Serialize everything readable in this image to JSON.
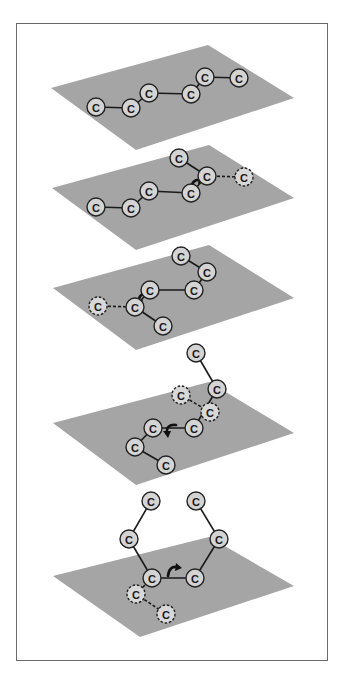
{
  "figure": {
    "colors": {
      "plane": "#a5a5a5",
      "atom_fill": "#d4d4d4",
      "atom_stroke": "#222222",
      "bond": "#1a1a1a",
      "frame": "#6a6a6a"
    },
    "atom_label": "C",
    "panels": [
      {
        "id": "step-1",
        "plane": [
          [
            208,
            45
          ],
          [
            294,
            98
          ],
          [
            136,
            150
          ],
          [
            51,
            88
          ]
        ],
        "atoms": [
          {
            "x": 96,
            "y": 107,
            "label": "C",
            "dashed": false
          },
          {
            "x": 131,
            "y": 108,
            "label": "C",
            "dashed": false
          },
          {
            "x": 149,
            "y": 93,
            "label": "C",
            "dashed": false
          },
          {
            "x": 191,
            "y": 94,
            "label": "C",
            "dashed": false
          },
          {
            "x": 205,
            "y": 77,
            "label": "C",
            "dashed": false
          },
          {
            "x": 239,
            "y": 78,
            "label": "C",
            "dashed": false
          }
        ],
        "bonds": [
          [
            0,
            1,
            false
          ],
          [
            1,
            2,
            false
          ],
          [
            2,
            3,
            false
          ],
          [
            3,
            4,
            false
          ],
          [
            4,
            5,
            false
          ]
        ],
        "arrow": null
      },
      {
        "id": "step-2",
        "plane": [
          [
            209,
            145
          ],
          [
            294,
            198
          ],
          [
            136,
            250
          ],
          [
            52,
            188
          ]
        ],
        "atoms": [
          {
            "x": 96,
            "y": 207,
            "label": "C",
            "dashed": false
          },
          {
            "x": 131,
            "y": 208,
            "label": "C",
            "dashed": false
          },
          {
            "x": 149,
            "y": 191,
            "label": "C",
            "dashed": false
          },
          {
            "x": 191,
            "y": 193,
            "label": "C",
            "dashed": false
          },
          {
            "x": 207,
            "y": 176,
            "label": "C",
            "dashed": false
          },
          {
            "x": 179,
            "y": 158,
            "label": "C",
            "dashed": false
          },
          {
            "x": 244,
            "y": 177,
            "label": "C",
            "dashed": true
          }
        ],
        "bonds": [
          [
            0,
            1,
            false
          ],
          [
            1,
            2,
            false
          ],
          [
            2,
            3,
            false
          ],
          [
            3,
            4,
            false
          ],
          [
            4,
            5,
            false
          ],
          [
            4,
            6,
            true
          ]
        ],
        "arrow": {
          "cx": 196,
          "cy": 185,
          "dir": "cw"
        }
      },
      {
        "id": "step-3",
        "plane": [
          [
            209,
            245
          ],
          [
            294,
            298
          ],
          [
            136,
            350
          ],
          [
            53,
            288
          ]
        ],
        "atoms": [
          {
            "x": 98,
            "y": 306,
            "label": "C",
            "dashed": true
          },
          {
            "x": 135,
            "y": 307,
            "label": "C",
            "dashed": false
          },
          {
            "x": 150,
            "y": 290,
            "label": "C",
            "dashed": false
          },
          {
            "x": 194,
            "y": 290,
            "label": "C",
            "dashed": false
          },
          {
            "x": 207,
            "y": 272,
            "label": "C",
            "dashed": false
          },
          {
            "x": 181,
            "y": 256,
            "label": "C",
            "dashed": false
          },
          {
            "x": 163,
            "y": 326,
            "label": "C",
            "dashed": false
          }
        ],
        "bonds": [
          [
            0,
            1,
            true
          ],
          [
            1,
            2,
            false
          ],
          [
            2,
            3,
            false
          ],
          [
            3,
            4,
            false
          ],
          [
            4,
            5,
            false
          ],
          [
            1,
            6,
            false
          ]
        ],
        "arrow": {
          "cx": 143,
          "cy": 299,
          "dir": "ccw"
        }
      },
      {
        "id": "step-4",
        "plane": [
          [
            209,
            382
          ],
          [
            294,
            433
          ],
          [
            136,
            485
          ],
          [
            53,
            423
          ]
        ],
        "atoms": [
          {
            "x": 196,
            "y": 353,
            "label": "C",
            "dashed": false
          },
          {
            "x": 217,
            "y": 389,
            "label": "C",
            "dashed": false
          },
          {
            "x": 181,
            "y": 395,
            "label": "C",
            "dashed": true
          },
          {
            "x": 210,
            "y": 412,
            "label": "C",
            "dashed": true
          },
          {
            "x": 194,
            "y": 428,
            "label": "C",
            "dashed": false
          },
          {
            "x": 153,
            "y": 428,
            "label": "C",
            "dashed": false
          },
          {
            "x": 135,
            "y": 447,
            "label": "C",
            "dashed": false
          },
          {
            "x": 166,
            "y": 465,
            "label": "C",
            "dashed": false
          }
        ],
        "bonds": [
          [
            0,
            1,
            false
          ],
          [
            1,
            4,
            false
          ],
          [
            2,
            3,
            true
          ],
          [
            4,
            5,
            false
          ],
          [
            5,
            6,
            false
          ],
          [
            6,
            7,
            false
          ]
        ],
        "arrow": {
          "cx": 171,
          "cy": 430,
          "dir": "ccw"
        }
      },
      {
        "id": "step-5",
        "plane": [
          [
            209,
            537
          ],
          [
            294,
            586
          ],
          [
            140,
            637
          ],
          [
            53,
            576
          ]
        ],
        "atoms": [
          {
            "x": 151,
            "y": 501,
            "label": "C",
            "dashed": false
          },
          {
            "x": 196,
            "y": 501,
            "label": "C",
            "dashed": false
          },
          {
            "x": 129,
            "y": 539,
            "label": "C",
            "dashed": false
          },
          {
            "x": 219,
            "y": 539,
            "label": "C",
            "dashed": false
          },
          {
            "x": 152,
            "y": 578,
            "label": "C",
            "dashed": false
          },
          {
            "x": 195,
            "y": 578,
            "label": "C",
            "dashed": false
          },
          {
            "x": 136,
            "y": 594,
            "label": "C",
            "dashed": true
          },
          {
            "x": 166,
            "y": 614,
            "label": "C",
            "dashed": true
          }
        ],
        "bonds": [
          [
            0,
            2,
            false
          ],
          [
            2,
            4,
            false
          ],
          [
            4,
            5,
            false
          ],
          [
            5,
            3,
            false
          ],
          [
            3,
            1,
            false
          ],
          [
            4,
            6,
            true
          ],
          [
            6,
            7,
            true
          ]
        ],
        "arrow": {
          "cx": 173,
          "cy": 572,
          "dir": "cw"
        }
      }
    ]
  }
}
